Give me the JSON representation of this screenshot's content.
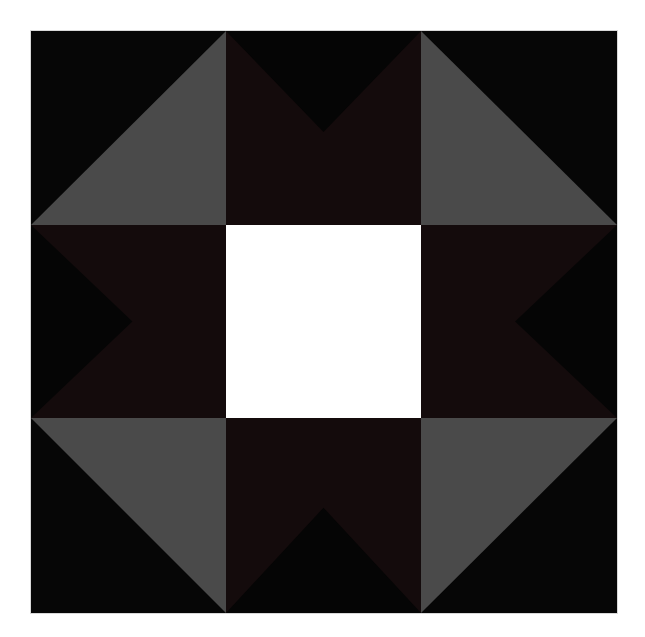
{
  "image": {
    "title": "Quilt Block - Shoofly Star Variation",
    "width": 645,
    "height": 637,
    "background_color": "#ffffff"
  },
  "block": {
    "name": "quilt-block",
    "x": 31,
    "y": 31,
    "width": 586,
    "height": 582,
    "grid_rows": 3,
    "grid_columns": 3,
    "border_color": "#d8d8d8"
  },
  "palette": {
    "gray": "#4a4a4a",
    "black": "#060606",
    "dark_maroon": "#140b0c",
    "white": "#ffffff"
  },
  "cells": [
    {
      "id": "top-left",
      "row": 0,
      "column": 0,
      "pattern": "half-square-triangle",
      "description": "Gray triangle lower-left, black triangle upper-right",
      "shapes": [
        {
          "name": "black-triangle",
          "color": "#060606",
          "points": "0,0 100,0 100,100 0,100"
        },
        {
          "name": "gray-triangle",
          "color": "#4a4a4a",
          "points": "0,100 100,0 100,100"
        }
      ]
    },
    {
      "id": "top-center",
      "row": 0,
      "column": 1,
      "pattern": "flying-geese-down",
      "description": "Dark maroon triangles at upper left and upper right forming a V of black",
      "shapes": [
        {
          "name": "maroon-background",
          "color": "#140b0c",
          "points": "0,0 100,0 100,100 0,100"
        },
        {
          "name": "black-v-triangle",
          "color": "#050505",
          "points": "0,0 100,0 50,52"
        }
      ]
    },
    {
      "id": "top-right",
      "row": 0,
      "column": 2,
      "pattern": "half-square-triangle",
      "description": "Gray triangle lower-left, black triangle upper-right",
      "shapes": [
        {
          "name": "black-triangle",
          "color": "#060606",
          "points": "0,0 100,0 100,100 0,100"
        },
        {
          "name": "gray-triangle",
          "color": "#4a4a4a",
          "points": "0,0 0,100 100,100"
        }
      ]
    },
    {
      "id": "middle-left",
      "row": 1,
      "column": 0,
      "pattern": "flying-geese-right",
      "description": "Black chevron pointing right on dark maroon",
      "shapes": [
        {
          "name": "maroon-background",
          "color": "#140b0c",
          "points": "0,0 100,0 100,100 0,100"
        },
        {
          "name": "black-chevron-triangle",
          "color": "#050505",
          "points": "0,0 52,50 0,100"
        }
      ]
    },
    {
      "id": "center",
      "row": 1,
      "column": 1,
      "pattern": "solid-square",
      "description": "Plain white center square",
      "shapes": [
        {
          "name": "white-square",
          "color": "#ffffff",
          "points": "0,0 100,0 100,100 0,100"
        }
      ]
    },
    {
      "id": "middle-right",
      "row": 1,
      "column": 2,
      "pattern": "flying-geese-left",
      "description": "Black chevron pointing left on dark maroon",
      "shapes": [
        {
          "name": "maroon-background",
          "color": "#140b0c",
          "points": "0,0 100,0 100,100 0,100"
        },
        {
          "name": "black-chevron-triangle",
          "color": "#050505",
          "points": "100,0 48,50 100,100"
        }
      ]
    },
    {
      "id": "bottom-left",
      "row": 2,
      "column": 0,
      "pattern": "half-square-triangle",
      "description": "Gray triangle upper-right, black triangle lower-left",
      "shapes": [
        {
          "name": "black-triangle",
          "color": "#060606",
          "points": "0,0 100,0 100,100 0,100"
        },
        {
          "name": "gray-triangle",
          "color": "#4a4a4a",
          "points": "0,0 100,0 100,100"
        }
      ]
    },
    {
      "id": "bottom-center",
      "row": 2,
      "column": 1,
      "pattern": "flying-geese-up",
      "description": "Black peak pointing up on dark maroon",
      "shapes": [
        {
          "name": "maroon-background",
          "color": "#140b0c",
          "points": "0,0 100,0 100,100 0,100"
        },
        {
          "name": "black-peak-triangle",
          "color": "#050505",
          "points": "50,46 100,100 0,100"
        }
      ]
    },
    {
      "id": "bottom-right",
      "row": 2,
      "column": 2,
      "pattern": "half-square-triangle",
      "description": "Gray triangle upper-left, black triangle lower-right",
      "shapes": [
        {
          "name": "black-triangle",
          "color": "#060606",
          "points": "0,0 100,0 100,100 0,100"
        },
        {
          "name": "gray-triangle",
          "color": "#4a4a4a",
          "points": "0,0 100,0 0,100"
        }
      ]
    }
  ]
}
